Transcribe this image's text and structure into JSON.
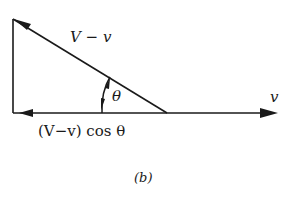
{
  "diagram": {
    "type": "vector-triangle",
    "caption": "(b)",
    "labels": {
      "hypotenuse": "V − v",
      "angle": "θ",
      "horizontal_right": "v",
      "horizontal_component": "(V−v) cos θ"
    },
    "colors": {
      "stroke": "#1a1a1a",
      "background": "#ffffff"
    }
  }
}
